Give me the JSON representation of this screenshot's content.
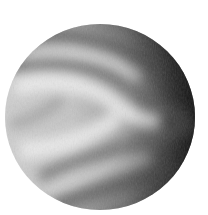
{
  "image": {
    "subject": "planet",
    "description": "Grayscale rendering of a planet (Venus-like) showing cloud bands in a sideways chevron pattern, lit from the left with a dark terminator on the right",
    "canvas": {
      "width": 208,
      "height": 215,
      "background": "#ffffff"
    },
    "planet": {
      "cx": 100,
      "cy": 117,
      "rx": 95,
      "ry": 93,
      "colors": {
        "highlight": "#e6e6e6",
        "mid": "#a8a8a8",
        "shadow": "#1c1c1c",
        "band_light": "#f0f0f0",
        "band_dark": "#6e6e6e"
      }
    }
  }
}
